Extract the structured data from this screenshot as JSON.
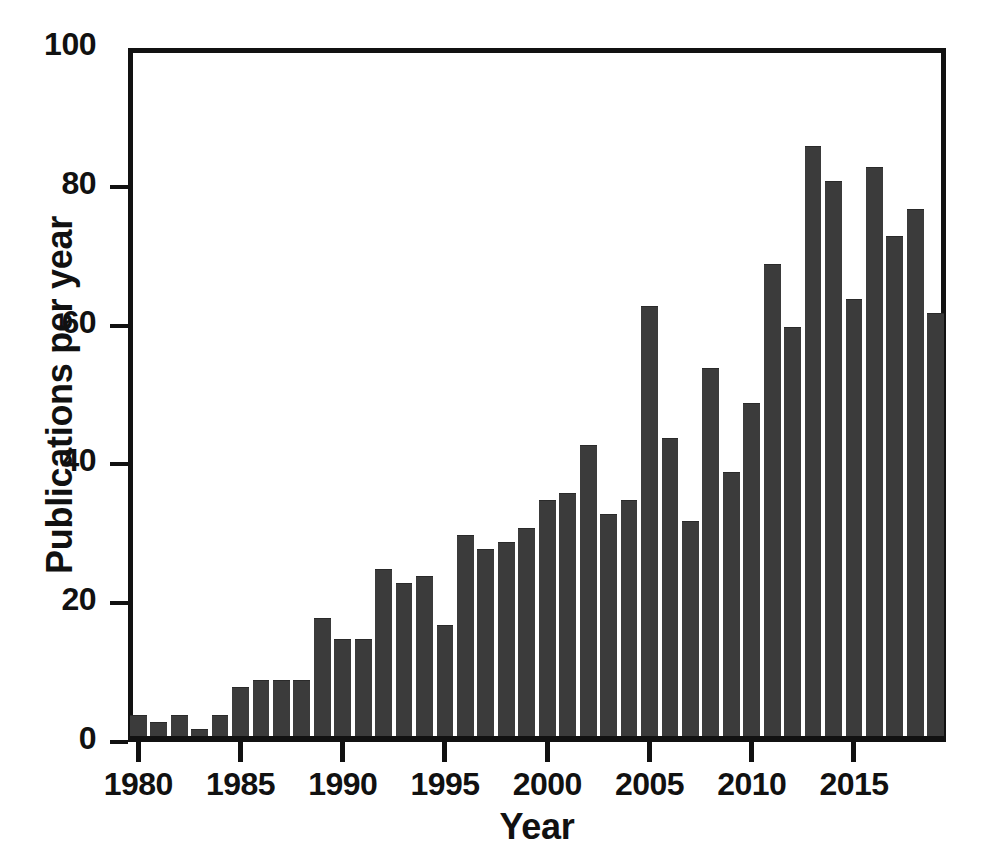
{
  "chart_data": {
    "type": "bar",
    "title": "",
    "xlabel": "Year",
    "ylabel": "Publications per year",
    "categories": [
      1980,
      1981,
      1982,
      1983,
      1984,
      1985,
      1986,
      1987,
      1988,
      1989,
      1990,
      1991,
      1992,
      1993,
      1994,
      1995,
      1996,
      1997,
      1998,
      1999,
      2000,
      2001,
      2002,
      2003,
      2004,
      2005,
      2006,
      2007,
      2008,
      2009,
      2010,
      2011,
      2012,
      2013,
      2014,
      2015,
      2016,
      2017,
      2018,
      2019
    ],
    "values": [
      3,
      2,
      3,
      1,
      3,
      7,
      8,
      8,
      8,
      17,
      14,
      14,
      24,
      22,
      23,
      16,
      29,
      27,
      28,
      30,
      34,
      35,
      42,
      32,
      34,
      62,
      43,
      31,
      53,
      38,
      48,
      68,
      59,
      85,
      80,
      63,
      82,
      72,
      76,
      61
    ],
    "xlim": [
      1979.5,
      2019.5
    ],
    "ylim": [
      0,
      100
    ],
    "yticks": [
      0,
      20,
      40,
      60,
      80,
      100
    ],
    "ytick_labels": [
      "0",
      "20",
      "40",
      "60",
      "80",
      "100"
    ],
    "xticks": [
      1980,
      1985,
      1990,
      1995,
      2000,
      2005,
      2010,
      2015
    ],
    "xtick_labels": [
      "1980",
      "1985",
      "1990",
      "1995",
      "2000",
      "2005",
      "2010",
      "2015"
    ],
    "grid": false,
    "legend": null,
    "bar_color": "#3b3b3b",
    "axis_color": "#111111",
    "background_color": "#ffffff"
  }
}
